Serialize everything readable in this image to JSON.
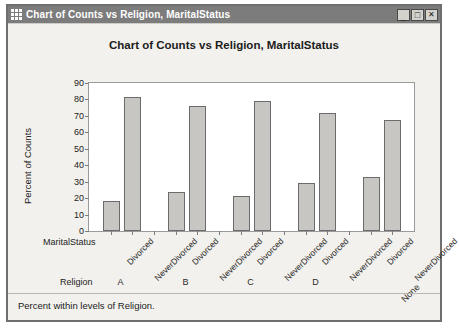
{
  "window": {
    "title": "Chart of Counts vs Religion, MaritalStatus",
    "icon": "chart-grid-icon",
    "controls": {
      "minimize": "_",
      "maximize": "□",
      "close": "✕"
    }
  },
  "footer": {
    "note": "Percent within levels of Religion."
  },
  "chart_data": {
    "type": "bar",
    "title": "Chart of Counts vs Religion, MaritalStatus",
    "xlabel": "",
    "ylabel": "Percent of Counts",
    "ylim": [
      0,
      90
    ],
    "ytick_step": 10,
    "yticks": [
      0,
      10,
      20,
      30,
      40,
      50,
      60,
      70,
      80,
      90
    ],
    "grid": false,
    "legend": "none",
    "bar_color": "#c8c6c2",
    "bar_border_color": "#6b6b6b",
    "plot_background": "#ffffff",
    "axis_group_names": {
      "inner": "MaritalStatus",
      "outer": "Religion"
    },
    "categories": [
      "A",
      "B",
      "C",
      "D",
      "None"
    ],
    "subcategories": [
      "Divorced",
      "NeverDivorced"
    ],
    "groups": [
      {
        "category": "A",
        "values": [
          18.5,
          81.5
        ]
      },
      {
        "category": "B",
        "values": [
          24.0,
          76.0
        ]
      },
      {
        "category": "C",
        "values": [
          21.5,
          79.0
        ]
      },
      {
        "category": "D",
        "values": [
          29.0,
          72.0
        ]
      },
      {
        "category": "None",
        "values": [
          33.0,
          67.5
        ]
      }
    ],
    "series": [
      {
        "name": "Divorced",
        "values": [
          18.5,
          24.0,
          21.5,
          29.0,
          33.0
        ]
      },
      {
        "name": "NeverDivorced",
        "values": [
          81.5,
          76.0,
          79.0,
          72.0,
          67.5
        ]
      }
    ]
  }
}
